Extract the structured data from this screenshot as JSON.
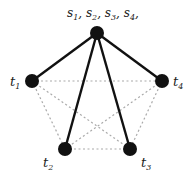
{
  "diagram": {
    "type": "graph",
    "colors": {
      "node": "#111111",
      "solid_edge": "#111111",
      "dotted_edge": "#aaaaaa",
      "background": "#ffffff"
    },
    "hub": {
      "id": "s",
      "label_parts": [
        {
          "base": "s",
          "sub": "1",
          "sep": ","
        },
        {
          "base": "s",
          "sub": "2",
          "sep": ","
        },
        {
          "base": "s",
          "sub": "3",
          "sep": ","
        },
        {
          "base": "s",
          "sub": "4",
          "sep": ","
        }
      ]
    },
    "nodes": [
      {
        "id": "t1",
        "base": "t",
        "sub": "1"
      },
      {
        "id": "t2",
        "base": "t",
        "sub": "2"
      },
      {
        "id": "t3",
        "base": "t",
        "sub": "3"
      },
      {
        "id": "t4",
        "base": "t",
        "sub": "4"
      }
    ],
    "solid_edges": [
      [
        "s",
        "t1"
      ],
      [
        "s",
        "t2"
      ],
      [
        "s",
        "t3"
      ],
      [
        "s",
        "t4"
      ]
    ],
    "dotted_edges": [
      [
        "t1",
        "t4"
      ],
      [
        "t1",
        "t2"
      ],
      [
        "t4",
        "t3"
      ],
      [
        "t2",
        "t3"
      ],
      [
        "t1",
        "t3"
      ],
      [
        "t4",
        "t2"
      ]
    ]
  }
}
